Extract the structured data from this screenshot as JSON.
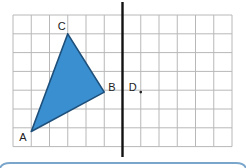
{
  "figure": {
    "grid": {
      "columns": 12,
      "rows": 7
    },
    "mirror_line_column": 6,
    "triangle": {
      "fill_color": "#3a8fd0",
      "stroke_color": "#1d4f7a",
      "vertices": [
        {
          "label": "A",
          "col": 1,
          "row": 6.2
        },
        {
          "label": "B",
          "col": 5,
          "row": 4.1
        },
        {
          "label": "C",
          "col": 3,
          "row": 1
        }
      ]
    },
    "points": [
      {
        "label": "D",
        "col": 7,
        "row": 4.1
      }
    ],
    "colors": {
      "grid": "#b8b8b8",
      "mirror_line": "#111111",
      "bottom_edge": "#7aa6cc"
    }
  }
}
